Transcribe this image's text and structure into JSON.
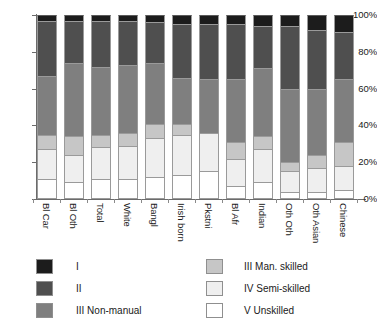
{
  "chart_data": {
    "type": "bar",
    "subtype": "stacked-percentage",
    "title": "",
    "xlabel": "",
    "ylabel": "",
    "ylim": [
      0,
      100
    ],
    "yticks": [
      "0%",
      "20%",
      "40%",
      "60%",
      "80%",
      "100%"
    ],
    "ytick_values": [
      0,
      20,
      40,
      60,
      80,
      100
    ],
    "grid": false,
    "legend_position": "bottom",
    "stack_order_bottom_to_top": [
      "V Unskilled",
      "IV Semi-skilled",
      "III Man. skilled",
      "III Non-manual",
      "II",
      "I"
    ],
    "categories": [
      "Bl Car",
      "Bl Oth",
      "Total",
      "White",
      "Bangl",
      "Irish born",
      "Pkstni",
      "Bl Afr",
      "Indian",
      "Oth Oth",
      "Oth Asian",
      "Chinese"
    ],
    "series": [
      {
        "name": "I",
        "color": "#1c1c1c",
        "values": [
          3,
          3,
          3,
          3,
          4,
          5,
          5,
          5,
          6,
          6,
          8,
          9
        ]
      },
      {
        "name": "II",
        "color": "#4f4f4f",
        "values": [
          30,
          23,
          25,
          24,
          22,
          29,
          30,
          30,
          23,
          34,
          32,
          26
        ]
      },
      {
        "name": "III Non-manual",
        "color": "#7f7f7f",
        "values": [
          32,
          40,
          37,
          37,
          33,
          25,
          29,
          34,
          37,
          40,
          36,
          34
        ]
      },
      {
        "name": "III Man. skilled",
        "color": "#c6c6c6",
        "values": [
          8,
          10,
          7,
          7,
          8,
          6,
          0,
          9,
          7,
          5,
          7,
          13
        ]
      },
      {
        "name": "IV Semi-skilled",
        "color": "#efefef",
        "values": [
          16,
          15,
          17,
          18,
          21,
          22,
          21,
          15,
          18,
          11,
          13,
          13
        ]
      },
      {
        "name": "V Unskilled",
        "color": "#ffffff",
        "values": [
          11,
          9,
          11,
          11,
          12,
          13,
          15,
          7,
          9,
          4,
          4,
          5
        ]
      }
    ],
    "legend_entries": [
      {
        "label": "I",
        "color": "#1c1c1c",
        "column": 1
      },
      {
        "label": "II",
        "color": "#4f4f4f",
        "column": 1
      },
      {
        "label": "III Non-manual",
        "color": "#7f7f7f",
        "column": 1
      },
      {
        "label": "III Man. skilled",
        "color": "#c6c6c6",
        "column": 2
      },
      {
        "label": "IV Semi-skilled",
        "color": "#efefef",
        "column": 2
      },
      {
        "label": "V Unskilled",
        "color": "#ffffff",
        "column": 2
      }
    ]
  }
}
